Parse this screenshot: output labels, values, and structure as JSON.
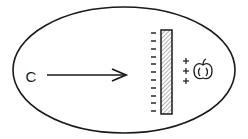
{
  "diagram": {
    "type": "physics-illustration",
    "charge_label": "C",
    "barrier": {
      "left_side_charge": "-",
      "minus_count": 11,
      "fill": "hatched"
    },
    "induced_charges": {
      "symbol": "+",
      "count": 3
    },
    "target_object": "apple",
    "arrow": {
      "direction": "right",
      "from": "C",
      "to": "barrier"
    },
    "colors": {
      "stroke": "#1a1a1a",
      "background": "#ffffff",
      "hatch": "#555555"
    }
  }
}
